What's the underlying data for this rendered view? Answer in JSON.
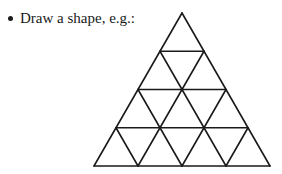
{
  "instruction": {
    "bullet_icon": "bullet-dot",
    "text": "Draw a shape, e.g.:"
  },
  "figure": {
    "rows": 4,
    "stroke_color": "#1a1a1a"
  }
}
